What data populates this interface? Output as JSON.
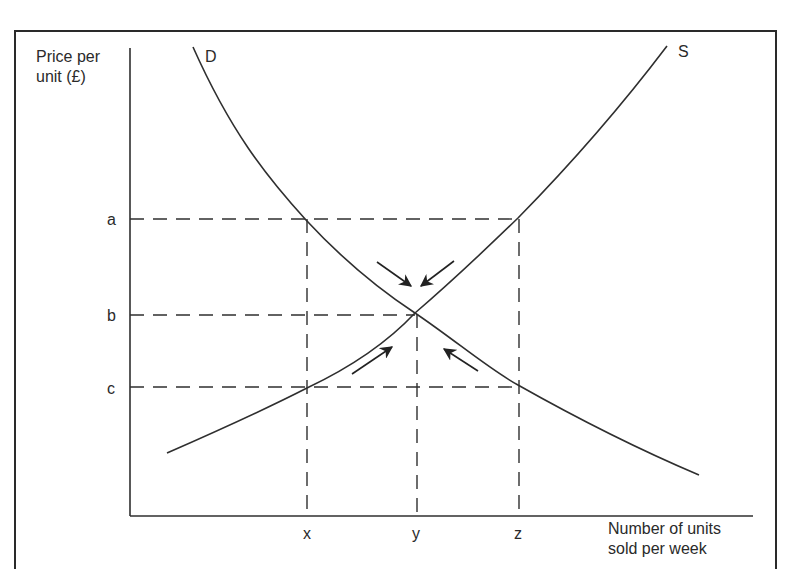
{
  "axes": {
    "y_label_line1": "Price per",
    "y_label_line2": "unit (£)",
    "x_label_line1": "Number of units",
    "x_label_line2": "sold per week"
  },
  "price_levels": [
    {
      "label": "a"
    },
    {
      "label": "b"
    },
    {
      "label": "c"
    }
  ],
  "quantity_levels": [
    {
      "label": "x"
    },
    {
      "label": "y"
    },
    {
      "label": "z"
    }
  ],
  "curves": {
    "demand_label": "D",
    "supply_label": "S"
  },
  "annotations": {
    "arrows": "Four arrows pointing toward the equilibrium point (y, b)"
  },
  "colors": {
    "line": "#2f2f2f",
    "background": "#ffffff"
  }
}
